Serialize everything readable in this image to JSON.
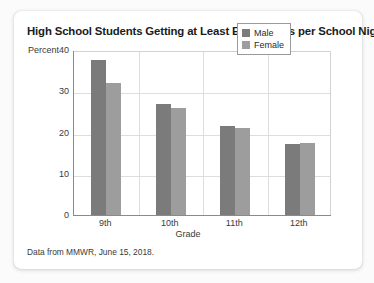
{
  "card": {
    "title": "High School Students Getting at Least Eight Hours per School Night",
    "footnote": "Data from MMWR, June 15, 2018."
  },
  "legend": {
    "entries": [
      {
        "label": "Male",
        "color": "#7b7b7b"
      },
      {
        "label": "Female",
        "color": "#9d9d9d"
      }
    ]
  },
  "chart_data": {
    "type": "bar",
    "title": "High School Students Getting at Least Eight Hours per School Night",
    "subtitle": "",
    "xlabel": "Grade",
    "ylabel": "Percent",
    "categories": [
      "9th",
      "10th",
      "11th",
      "12th"
    ],
    "series": [
      {
        "name": "Male",
        "color": "#7b7b7b",
        "values": [
          37.5,
          27.0,
          21.5,
          17.2
        ]
      },
      {
        "name": "Female",
        "color": "#9d9d9d",
        "values": [
          32.0,
          26.0,
          21.0,
          17.5
        ]
      }
    ],
    "ylim": [
      0,
      40
    ],
    "yticks": [
      0,
      10,
      20,
      30,
      40
    ],
    "ytick_labels": [
      "0",
      "10",
      "20",
      "30",
      "40"
    ],
    "grid": true,
    "grid_axis": "both",
    "legend_position": "top-right",
    "annotations": [
      "Data from MMWR, June 15, 2018."
    ]
  }
}
